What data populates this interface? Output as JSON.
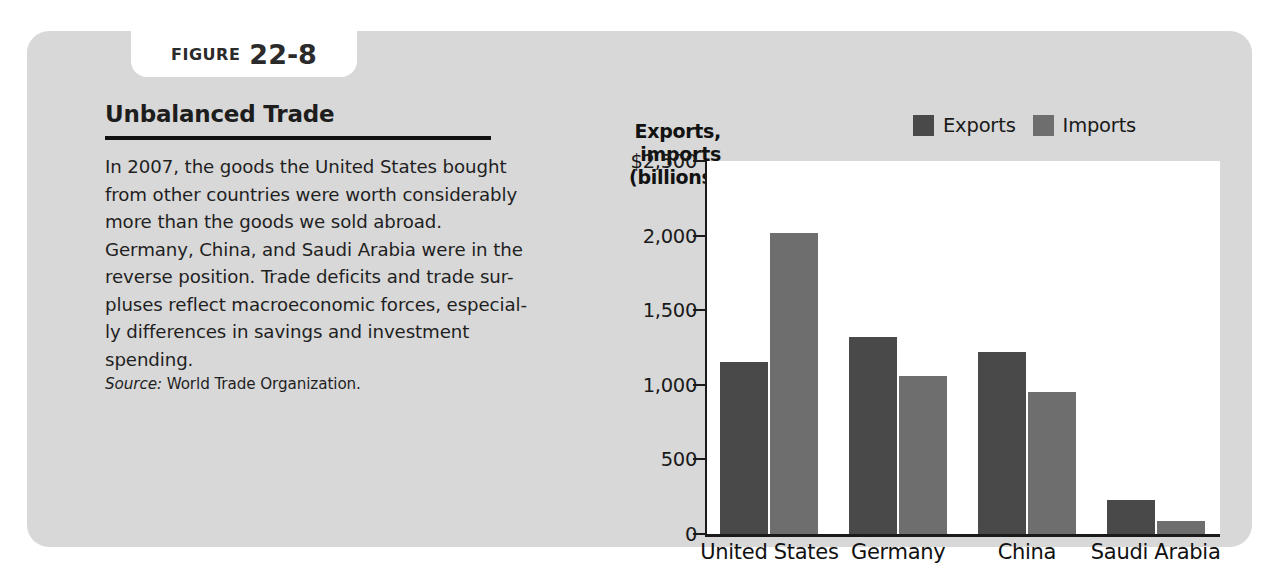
{
  "figure": {
    "label_word": "FIGURE",
    "number": "22-8",
    "title": "Unbalanced Trade",
    "body_lines": [
      "In 2007, the goods the United States bought",
      "from other countries were worth considerably",
      "more than the goods we sold abroad.",
      "Germany, China, and Saudi Arabia were in the",
      "reverse position. Trade deficits and trade sur-",
      "pluses reflect macroeconomic forces, especial-",
      "ly differences in savings and investment",
      "spending."
    ],
    "source_label": "Source:",
    "source_text": "World Trade Organization."
  },
  "colors": {
    "panel_background": "#d8d8d8",
    "plot_background": "#ffffff",
    "exports": "#494949",
    "imports": "#6e6e6e",
    "axis": "#1a1a1a",
    "text": "#1f1f1f"
  },
  "chart_data": {
    "type": "bar",
    "title": "Unbalanced Trade",
    "ylabel_lines": [
      "Exports,",
      "imports",
      "(billions)"
    ],
    "ylabel": "Exports, imports (billions)",
    "xlabel": "",
    "categories": [
      "United States",
      "Germany",
      "China",
      "Saudi Arabia"
    ],
    "series": [
      {
        "name": "Exports",
        "color": "#494949",
        "values": [
          1150,
          1320,
          1220,
          230
        ]
      },
      {
        "name": "Imports",
        "color": "#6e6e6e",
        "values": [
          2020,
          1060,
          955,
          90
        ]
      }
    ],
    "ylim": [
      0,
      2500
    ],
    "yticks": [
      0,
      500,
      1000,
      1500,
      2000,
      2500
    ],
    "ytick_labels": [
      "0",
      "500",
      "1,000",
      "1,500",
      "2,000",
      "$2,500"
    ],
    "grid": false,
    "legend_position": "top-right",
    "legend_entries": [
      "Exports",
      "Imports"
    ]
  }
}
